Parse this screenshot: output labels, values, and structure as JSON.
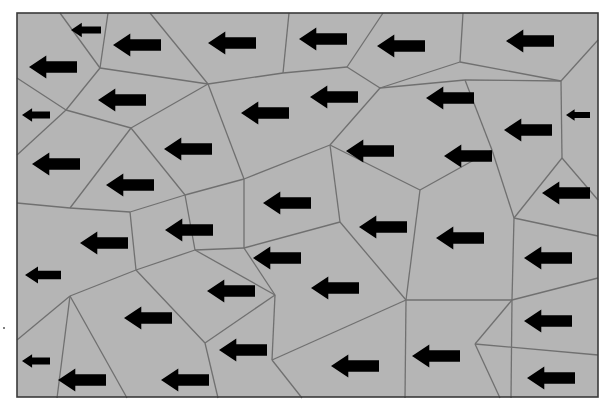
{
  "diagram": {
    "colors": {
      "cell_fill": "#b5b5b5",
      "edge": "#707070",
      "frame": "#3a3a3a",
      "arrow": "#000000"
    },
    "frame": {
      "x": 17,
      "y": 13,
      "width": 581,
      "height": 384
    },
    "arrow_direction": "left",
    "arrows": [
      {
        "x": 86,
        "y": 30,
        "w": 30
      },
      {
        "x": 137,
        "y": 45,
        "w": 48
      },
      {
        "x": 232,
        "y": 43,
        "w": 48
      },
      {
        "x": 323,
        "y": 39,
        "w": 48
      },
      {
        "x": 401,
        "y": 46,
        "w": 48
      },
      {
        "x": 530,
        "y": 41,
        "w": 48
      },
      {
        "x": 53,
        "y": 67,
        "w": 48
      },
      {
        "x": 122,
        "y": 100,
        "w": 48
      },
      {
        "x": 265,
        "y": 113,
        "w": 48
      },
      {
        "x": 334,
        "y": 97,
        "w": 48
      },
      {
        "x": 450,
        "y": 98,
        "w": 48
      },
      {
        "x": 36,
        "y": 115,
        "w": 28
      },
      {
        "x": 578,
        "y": 115,
        "w": 24
      },
      {
        "x": 528,
        "y": 130,
        "w": 48
      },
      {
        "x": 188,
        "y": 149,
        "w": 48
      },
      {
        "x": 370,
        "y": 151,
        "w": 48
      },
      {
        "x": 468,
        "y": 156,
        "w": 48
      },
      {
        "x": 56,
        "y": 164,
        "w": 48
      },
      {
        "x": 130,
        "y": 185,
        "w": 48
      },
      {
        "x": 566,
        "y": 193,
        "w": 48
      },
      {
        "x": 287,
        "y": 203,
        "w": 48
      },
      {
        "x": 104,
        "y": 243,
        "w": 48
      },
      {
        "x": 189,
        "y": 230,
        "w": 48
      },
      {
        "x": 383,
        "y": 227,
        "w": 48
      },
      {
        "x": 460,
        "y": 238,
        "w": 48
      },
      {
        "x": 277,
        "y": 258,
        "w": 48
      },
      {
        "x": 548,
        "y": 258,
        "w": 48
      },
      {
        "x": 43,
        "y": 275,
        "w": 36
      },
      {
        "x": 231,
        "y": 291,
        "w": 48
      },
      {
        "x": 335,
        "y": 288,
        "w": 48
      },
      {
        "x": 148,
        "y": 318,
        "w": 48
      },
      {
        "x": 548,
        "y": 321,
        "w": 48
      },
      {
        "x": 243,
        "y": 350,
        "w": 48
      },
      {
        "x": 36,
        "y": 361,
        "w": 28
      },
      {
        "x": 436,
        "y": 356,
        "w": 48
      },
      {
        "x": 355,
        "y": 366,
        "w": 48
      },
      {
        "x": 82,
        "y": 380,
        "w": 48
      },
      {
        "x": 185,
        "y": 380,
        "w": 48
      },
      {
        "x": 551,
        "y": 378,
        "w": 48
      }
    ],
    "edges": [
      [
        60,
        13,
        100,
        68
      ],
      [
        108,
        13,
        100,
        68
      ],
      [
        17,
        78,
        66,
        110
      ],
      [
        100,
        68,
        66,
        110
      ],
      [
        66,
        110,
        17,
        155
      ],
      [
        100,
        68,
        208,
        84
      ],
      [
        150,
        13,
        208,
        84
      ],
      [
        208,
        84,
        283,
        73
      ],
      [
        283,
        73,
        289,
        13
      ],
      [
        283,
        73,
        347,
        67
      ],
      [
        347,
        67,
        383,
        13
      ],
      [
        347,
        67,
        380,
        88
      ],
      [
        380,
        88,
        460,
        62
      ],
      [
        460,
        62,
        463,
        13
      ],
      [
        460,
        62,
        561,
        81
      ],
      [
        561,
        81,
        598,
        40
      ],
      [
        561,
        81,
        562,
        158
      ],
      [
        66,
        110,
        131,
        128
      ],
      [
        131,
        128,
        208,
        84
      ],
      [
        131,
        128,
        70,
        208
      ],
      [
        17,
        203,
        70,
        208
      ],
      [
        70,
        208,
        130,
        212
      ],
      [
        131,
        128,
        185,
        195
      ],
      [
        185,
        195,
        244,
        179
      ],
      [
        244,
        179,
        208,
        84
      ],
      [
        244,
        179,
        330,
        145
      ],
      [
        330,
        145,
        380,
        88
      ],
      [
        330,
        145,
        340,
        222
      ],
      [
        340,
        222,
        244,
        248
      ],
      [
        244,
        248,
        244,
        179
      ],
      [
        130,
        212,
        185,
        195
      ],
      [
        130,
        212,
        136,
        270
      ],
      [
        136,
        270,
        195,
        250
      ],
      [
        195,
        250,
        185,
        195
      ],
      [
        195,
        250,
        244,
        248
      ],
      [
        136,
        270,
        70,
        296
      ],
      [
        70,
        296,
        17,
        340
      ],
      [
        70,
        296,
        57,
        398
      ],
      [
        70,
        296,
        127,
        398
      ],
      [
        195,
        250,
        275,
        295
      ],
      [
        244,
        248,
        275,
        295
      ],
      [
        340,
        222,
        406,
        300
      ],
      [
        406,
        300,
        420,
        190
      ],
      [
        420,
        190,
        330,
        145
      ],
      [
        420,
        190,
        492,
        150
      ],
      [
        492,
        150,
        465,
        80
      ],
      [
        465,
        80,
        380,
        88
      ],
      [
        465,
        80,
        561,
        81
      ],
      [
        492,
        150,
        514,
        218
      ],
      [
        514,
        218,
        562,
        158
      ],
      [
        562,
        158,
        598,
        200
      ],
      [
        514,
        218,
        598,
        236
      ],
      [
        514,
        218,
        512,
        300
      ],
      [
        406,
        300,
        512,
        300
      ],
      [
        406,
        300,
        405,
        398
      ],
      [
        406,
        300,
        272,
        360
      ],
      [
        272,
        360,
        275,
        295
      ],
      [
        272,
        360,
        302,
        398
      ],
      [
        275,
        295,
        205,
        343
      ],
      [
        205,
        343,
        218,
        398
      ],
      [
        205,
        343,
        136,
        270
      ],
      [
        512,
        300,
        475,
        344
      ],
      [
        475,
        344,
        500,
        398
      ],
      [
        475,
        344,
        598,
        355
      ],
      [
        512,
        300,
        598,
        278
      ],
      [
        512,
        300,
        511,
        398
      ]
    ],
    "stray_mark": {
      "x": 4,
      "y": 328
    }
  }
}
